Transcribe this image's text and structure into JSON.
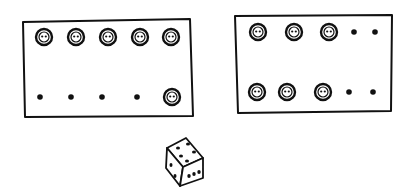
{
  "illustration": {
    "description": "Hand-drawn sketch of two boards holding buttons and dots, with a die below",
    "ink_color": "#111111",
    "background": "#ffffff",
    "left_board": {
      "top_row": [
        "button",
        "button",
        "button",
        "button",
        "button"
      ],
      "bottom_row": [
        "dot",
        "dot",
        "dot",
        "dot",
        "button"
      ]
    },
    "right_board": {
      "top_row": [
        "button",
        "button",
        "button",
        "dot",
        "dot"
      ],
      "bottom_row": [
        "button",
        "button",
        "button",
        "dot",
        "dot"
      ]
    },
    "die": {
      "top_face_pips": 5,
      "right_face_pips": 3,
      "left_face_pips": 2
    }
  }
}
